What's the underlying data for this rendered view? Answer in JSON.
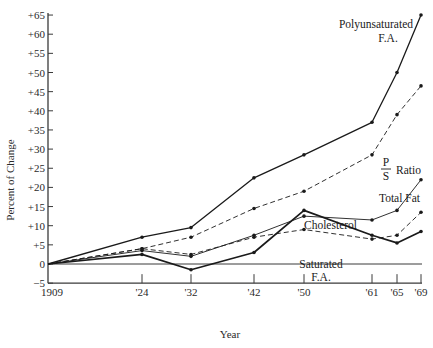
{
  "chart_data": {
    "type": "line",
    "title": "",
    "xlabel": "Year",
    "ylabel": "Percent of Change",
    "ylim": [
      -5,
      65
    ],
    "y_ticks": [
      "+65",
      "+60",
      "+55",
      "+50",
      "+45",
      "+40",
      "+35",
      "+30",
      "+25",
      "+20",
      "+15",
      "+10",
      "+5",
      "0",
      "−5"
    ],
    "y_tick_values": [
      65,
      60,
      55,
      50,
      45,
      40,
      35,
      30,
      25,
      20,
      15,
      10,
      5,
      0,
      -5
    ],
    "categories": [
      "1909",
      "'24",
      "'32",
      "'42",
      "'50",
      "'61",
      "'65",
      "'69"
    ],
    "x_years": [
      1909,
      1924,
      1932,
      1942,
      1950,
      1961,
      1965,
      1969
    ],
    "grid": false,
    "baseline_at_zero": true,
    "series": [
      {
        "name": "Polyunsaturated F.A.",
        "label_lines": [
          "Polyunsaturated",
          "F.A."
        ],
        "style": "solid",
        "weight": "medium",
        "values": [
          0,
          7,
          9.5,
          22.5,
          28.5,
          37,
          50,
          65
        ]
      },
      {
        "name": "P/S Ratio",
        "label_lines": [
          "P",
          "S",
          "Ratio"
        ],
        "style": "dashed",
        "weight": "thin",
        "values": [
          0,
          4,
          7,
          14.5,
          19,
          28.5,
          39,
          46.5
        ]
      },
      {
        "name": "Total Fat",
        "label_lines": [
          "Total Fat"
        ],
        "style": "solid",
        "weight": "thin",
        "values": [
          0,
          3.5,
          2,
          7.5,
          12.5,
          11.5,
          14,
          22
        ]
      },
      {
        "name": "Cholesterol",
        "label_lines": [
          "Cholesterol"
        ],
        "style": "solid",
        "weight": "thick",
        "values": [
          0,
          2.5,
          -1.5,
          3,
          14,
          7.5,
          5.5,
          8.5
        ]
      },
      {
        "name": "Saturated F.A.",
        "label_lines": [
          "Saturated",
          "F.A."
        ],
        "style": "dashed",
        "weight": "thin",
        "values": [
          0,
          4,
          2.5,
          7,
          9,
          6.5,
          7.5,
          13.5
        ]
      }
    ],
    "legend": "inline labels near line ends"
  },
  "colors": {
    "ink": "#1a1a1a",
    "axis": "#3a3a3a",
    "background": "#ffffff"
  }
}
